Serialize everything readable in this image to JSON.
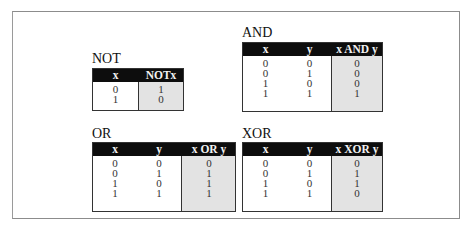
{
  "tables": {
    "not": {
      "title": "NOT",
      "headers": [
        "x",
        "NOTx"
      ],
      "rows": [
        [
          "0",
          "1"
        ],
        [
          "1",
          "0"
        ]
      ]
    },
    "and": {
      "title": "AND",
      "headers": [
        "x",
        "y",
        "x AND y"
      ],
      "rows": [
        [
          "0",
          "0",
          "0"
        ],
        [
          "0",
          "1",
          "0"
        ],
        [
          "1",
          "0",
          "0"
        ],
        [
          "1",
          "1",
          "1"
        ]
      ]
    },
    "or": {
      "title": "OR",
      "headers": [
        "x",
        "y",
        "x OR y"
      ],
      "rows": [
        [
          "0",
          "0",
          "0"
        ],
        [
          "0",
          "1",
          "1"
        ],
        [
          "1",
          "0",
          "1"
        ],
        [
          "1",
          "1",
          "1"
        ]
      ]
    },
    "xor": {
      "title": "XOR",
      "headers": [
        "x",
        "y",
        "x XOR y"
      ],
      "rows": [
        [
          "0",
          "0",
          "0"
        ],
        [
          "0",
          "1",
          "1"
        ],
        [
          "1",
          "0",
          "1"
        ],
        [
          "1",
          "1",
          "0"
        ]
      ]
    }
  },
  "colors": {
    "header_bg": "#0d0d0d",
    "header_text": "#f2f2f2",
    "result_shade": "#e3e3e3"
  }
}
